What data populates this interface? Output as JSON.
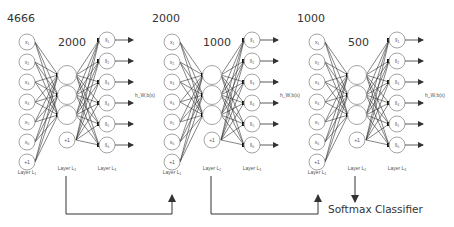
{
  "diagram": {
    "type": "stacked-autoencoder",
    "colors": {
      "line": "#333333",
      "node_stroke": "#9a9a9a",
      "text": "#333333"
    },
    "autoencoders": [
      {
        "input_size": "4666",
        "hidden_size": "2000",
        "input_nodes": [
          "x₁",
          "x₂",
          "x₃",
          "x₄",
          "x₅",
          "x₆",
          "+1"
        ],
        "hidden_nodes": [
          "",
          "",
          "",
          "+1"
        ],
        "output_nodes": [
          "x̂₁",
          "x̂₂",
          "x̂₃",
          "x̂₄",
          "x̂₅",
          "x̂₆"
        ],
        "output_label": "h_W,b(x)",
        "layer_labels": [
          "Layer L₁",
          "Layer L₂",
          "Layer L₃"
        ]
      },
      {
        "input_size": "2000",
        "hidden_size": "1000",
        "input_nodes": [
          "x₁",
          "x₂",
          "x₃",
          "x₄",
          "x₅",
          "x₆",
          "+1"
        ],
        "hidden_nodes": [
          "",
          "",
          "",
          "+1"
        ],
        "output_nodes": [
          "x̂₁",
          "x̂₂",
          "x̂₃",
          "x̂₄",
          "x̂₅",
          "x̂₆"
        ],
        "output_label": "h_W,b(x)",
        "layer_labels": [
          "Layer L₁",
          "Layer L₂",
          "Layer L₃"
        ]
      },
      {
        "input_size": "1000",
        "hidden_size": "500",
        "input_nodes": [
          "x₁",
          "x₂",
          "x₃",
          "x₄",
          "x₅",
          "x₆",
          "+1"
        ],
        "hidden_nodes": [
          "",
          "",
          "",
          "+1"
        ],
        "output_nodes": [
          "x̂₁",
          "x̂₂",
          "x̂₃",
          "x̂₄",
          "x̂₅",
          "x̂₆"
        ],
        "output_label": "h_W,b(x)",
        "layer_labels": [
          "Layer L₁",
          "Layer L₂",
          "Layer L₃"
        ]
      }
    ],
    "classifier_label": "Softmax Classifier",
    "connections": [
      {
        "from": "autoencoder-1 Layer L₂",
        "to": "autoencoder-2 Layer L₁"
      },
      {
        "from": "autoencoder-2 Layer L₂",
        "to": "autoencoder-3 Layer L₁"
      },
      {
        "from": "autoencoder-3 Layer L₂",
        "to": "Softmax Classifier"
      }
    ]
  }
}
